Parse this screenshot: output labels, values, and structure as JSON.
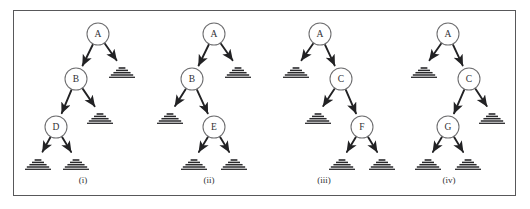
{
  "figure": {
    "background_color": "#ffffff",
    "border_color": "#58585a",
    "node_stroke_color": "#6e6e70",
    "edge_color": "#222224",
    "leaf_color": "#2a2a2c",
    "text_color": "#303033",
    "frame": {
      "x": 13,
      "y": 10,
      "width": 503,
      "height": 186
    }
  },
  "chart_data": {
    "type": "diagram",
    "title": "",
    "subtitle": "",
    "diagram_kind": "binary-tree-set",
    "panel_count": 4,
    "legend": [],
    "panels": [
      {
        "caption": "(i)",
        "center_x": 83,
        "nodes": [
          {
            "id": "n1",
            "label": "A",
            "x": 98,
            "y": 34,
            "r": 11
          },
          {
            "id": "n2",
            "label": "B",
            "x": 76,
            "y": 79,
            "r": 11
          },
          {
            "id": "n3",
            "label": "D",
            "x": 56,
            "y": 127,
            "r": 11
          }
        ],
        "leaves": [
          {
            "id": "l1",
            "x": 122,
            "y": 68,
            "w": 26
          },
          {
            "id": "l2",
            "x": 100,
            "y": 114,
            "w": 26
          },
          {
            "id": "l3",
            "x": 38,
            "y": 160,
            "w": 26
          },
          {
            "id": "l4",
            "x": 76,
            "y": 160,
            "w": 26
          }
        ],
        "edges": [
          {
            "from": "n1",
            "to": "n2"
          },
          {
            "from": "n1",
            "to": "l1"
          },
          {
            "from": "n2",
            "to": "n3"
          },
          {
            "from": "n2",
            "to": "l2"
          },
          {
            "from": "n3",
            "to": "l3"
          },
          {
            "from": "n3",
            "to": "l4"
          }
        ]
      },
      {
        "caption": "(ii)",
        "center_x": 209,
        "nodes": [
          {
            "id": "n1",
            "label": "A",
            "x": 214,
            "y": 34,
            "r": 11
          },
          {
            "id": "n2",
            "label": "B",
            "x": 192,
            "y": 79,
            "r": 11
          },
          {
            "id": "n3",
            "label": "E",
            "x": 214,
            "y": 127,
            "r": 11
          }
        ],
        "leaves": [
          {
            "id": "l1",
            "x": 238,
            "y": 68,
            "w": 26
          },
          {
            "id": "l2",
            "x": 170,
            "y": 114,
            "w": 26
          },
          {
            "id": "l3",
            "x": 194,
            "y": 160,
            "w": 26
          },
          {
            "id": "l4",
            "x": 234,
            "y": 160,
            "w": 26
          }
        ],
        "edges": [
          {
            "from": "n1",
            "to": "n2"
          },
          {
            "from": "n1",
            "to": "l1"
          },
          {
            "from": "n2",
            "to": "l2"
          },
          {
            "from": "n2",
            "to": "n3"
          },
          {
            "from": "n3",
            "to": "l3"
          },
          {
            "from": "n3",
            "to": "l4"
          }
        ]
      },
      {
        "caption": "(iii)",
        "center_x": 324,
        "nodes": [
          {
            "id": "n1",
            "label": "A",
            "x": 320,
            "y": 34,
            "r": 11
          },
          {
            "id": "n2",
            "label": "C",
            "x": 341,
            "y": 79,
            "r": 11
          },
          {
            "id": "n3",
            "label": "F",
            "x": 362,
            "y": 127,
            "r": 11
          }
        ],
        "leaves": [
          {
            "id": "l1",
            "x": 296,
            "y": 68,
            "w": 26
          },
          {
            "id": "l2",
            "x": 318,
            "y": 114,
            "w": 26
          },
          {
            "id": "l3",
            "x": 342,
            "y": 160,
            "w": 26
          },
          {
            "id": "l4",
            "x": 382,
            "y": 160,
            "w": 26
          }
        ],
        "edges": [
          {
            "from": "n1",
            "to": "l1"
          },
          {
            "from": "n1",
            "to": "n2"
          },
          {
            "from": "n2",
            "to": "l2"
          },
          {
            "from": "n2",
            "to": "n3"
          },
          {
            "from": "n3",
            "to": "l3"
          },
          {
            "from": "n3",
            "to": "l4"
          }
        ]
      },
      {
        "caption": "(iv)",
        "center_x": 449,
        "nodes": [
          {
            "id": "n1",
            "label": "A",
            "x": 448,
            "y": 34,
            "r": 11
          },
          {
            "id": "n2",
            "label": "C",
            "x": 469,
            "y": 79,
            "r": 11
          },
          {
            "id": "n3",
            "label": "G",
            "x": 448,
            "y": 127,
            "r": 11
          }
        ],
        "leaves": [
          {
            "id": "l1",
            "x": 424,
            "y": 68,
            "w": 26
          },
          {
            "id": "l2",
            "x": 492,
            "y": 114,
            "w": 26
          },
          {
            "id": "l3",
            "x": 428,
            "y": 160,
            "w": 26
          },
          {
            "id": "l4",
            "x": 468,
            "y": 160,
            "w": 26
          }
        ],
        "edges": [
          {
            "from": "n1",
            "to": "l1"
          },
          {
            "from": "n1",
            "to": "n2"
          },
          {
            "from": "n2",
            "to": "n3"
          },
          {
            "from": "n2",
            "to": "l2"
          },
          {
            "from": "n3",
            "to": "l3"
          },
          {
            "from": "n3",
            "to": "l4"
          }
        ]
      }
    ],
    "caption_y": 180
  }
}
